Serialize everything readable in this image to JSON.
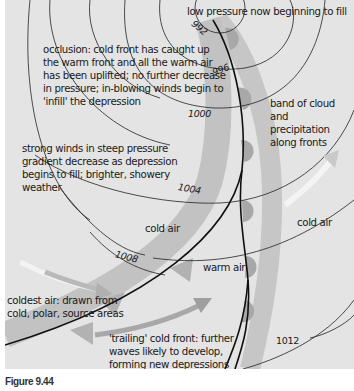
{
  "figure": {
    "caption": "Figure 9.44",
    "colors": {
      "background": "#e4e4e4",
      "band": "#c4c4c4",
      "front_semicircle": "#a6a6a6",
      "front_triangle": "#b4b4b4",
      "isobar": "#222222",
      "front_line": "#111111",
      "cold_arrow": "#ffffff",
      "warm_arrow": "#a8a8a8"
    }
  },
  "labels": {
    "low_pressure": "low pressure now beginning to fill",
    "occlusion": [
      "occlusion: cold front has caught up",
      "the warm front and all the warm air",
      "has been uplifted; no further decrease",
      "in pressure; in-blowing winds begin to",
      "'infill' the depression"
    ],
    "band_of_cloud": [
      "band of cloud",
      "and",
      "precipitation",
      "along fronts"
    ],
    "strong_winds": [
      "strong winds in steep pressure",
      "gradient decrease as depression",
      "begins to fill; brighter, showery",
      "weather"
    ],
    "cold_air_left": "cold air",
    "cold_air_right": "cold air",
    "warm_air": "warm air",
    "coldest_air": [
      "coldest air: drawn from",
      "cold, polar, source areas"
    ],
    "trailing_front": [
      "'trailing' cold front: further",
      "waves likely to develop,",
      "forming new depressions"
    ]
  },
  "isobars": {
    "992": "992",
    "996": "996",
    "1000": "1000",
    "1004": "1004",
    "1008": "1008",
    "1012": "1012"
  }
}
